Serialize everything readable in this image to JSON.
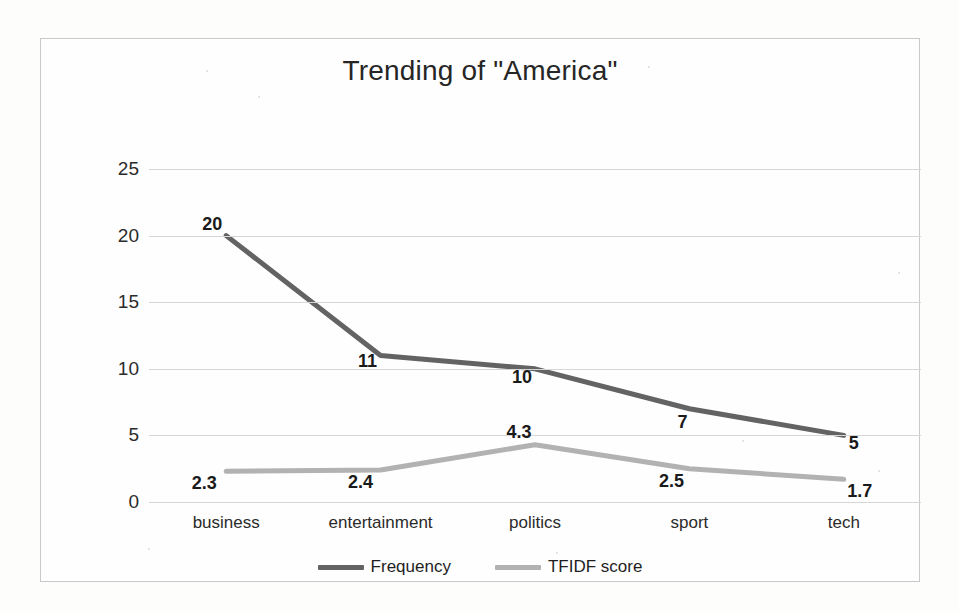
{
  "chart_data": {
    "type": "line",
    "title": "Trending of \"America\"",
    "xlabel": "",
    "ylabel": "",
    "categories": [
      "business",
      "entertainment",
      "politics",
      "sport",
      "tech"
    ],
    "series": [
      {
        "name": "Frequency",
        "color": "#636363",
        "values": [
          20,
          11,
          10,
          7,
          5
        ],
        "labels": [
          "20",
          "11",
          "10",
          "7",
          "5"
        ]
      },
      {
        "name": "TFIDF score",
        "color": "#b2b2b2",
        "values": [
          2.3,
          2.4,
          4.3,
          2.5,
          1.7
        ],
        "labels": [
          "2.3",
          "2.4",
          "4.3",
          "2.5",
          "1.7"
        ]
      }
    ],
    "ylim": [
      0,
      25
    ],
    "yticks": [
      "0",
      "5",
      "10",
      "15",
      "20",
      "25"
    ],
    "ytick_values": [
      0,
      5,
      10,
      15,
      20,
      25
    ],
    "grid": true,
    "legend_position": "bottom",
    "markers": false,
    "data_labels": true
  },
  "frame": {
    "border_color": "#c9c9c9",
    "background": "#fefefe",
    "gridline_color": "#d6d6d6"
  }
}
